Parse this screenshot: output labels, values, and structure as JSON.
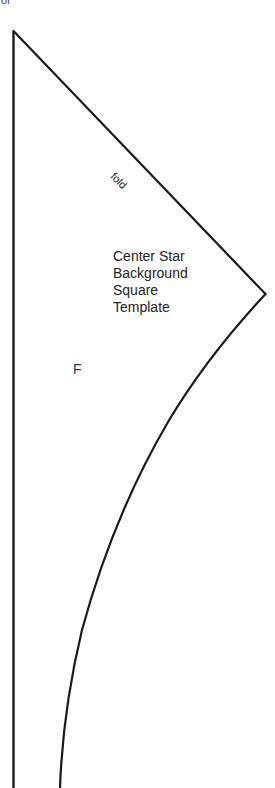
{
  "header_fragment": "of",
  "fold_label": "fold",
  "template_title": {
    "lines": [
      "Center Star",
      "Background",
      "Square",
      "Template"
    ]
  },
  "piece_letter": "F",
  "colors": {
    "line": "#1a1a1a",
    "background": "#ffffff",
    "text": "#222222"
  }
}
